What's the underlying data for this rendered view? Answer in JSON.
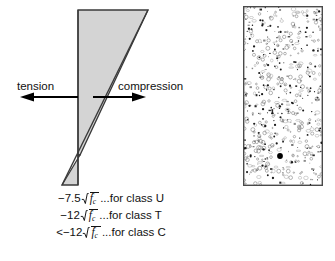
{
  "figure": {
    "stress_diagram": {
      "tension_label": "tension",
      "compression_label": "compression",
      "tension_arrow_direction": "left",
      "compression_arrow_direction": "right",
      "fill_color": "#d4d4d4",
      "outline_color": "#3a3a3a",
      "neutral_axis_y_fraction": 0.83,
      "description": "Linear stress diagram: compression block above neutral axis, tension wedge below"
    },
    "formulas": [
      {
        "prefix": "−7.5",
        "radicand_symbol": "f",
        "radicand_prime": "′",
        "radicand_subscript": "c",
        "suffix": "...for class U",
        "class": "U"
      },
      {
        "prefix": "−12",
        "radicand_symbol": "f",
        "radicand_prime": "′",
        "radicand_subscript": "c",
        "suffix": "...for class T",
        "class": "T"
      },
      {
        "prefix": "<−12",
        "radicand_symbol": "f",
        "radicand_prime": "′",
        "radicand_subscript": "c",
        "suffix": "...for class C",
        "class": "C"
      }
    ],
    "concrete_section": {
      "name": "concrete-cross-section",
      "border_color": "#4a4a4a",
      "fill_color": "#ffffff",
      "texture": "aggregate-speckle",
      "tendon_marker": {
        "shape": "filled-circle",
        "color": "#000000",
        "x_fraction": 0.46,
        "y_fraction": 0.83
      }
    }
  },
  "chart_data": {
    "type": "area",
    "xlabel": "stress",
    "ylabel": "depth",
    "series": [
      {
        "name": "compression",
        "x": [
          0,
          1
        ],
        "values": [
          1.0,
          0.0
        ],
        "region": "above-neutral-axis"
      },
      {
        "name": "tension",
        "x": [
          0,
          -0.22
        ],
        "values": [
          0.0,
          -0.17
        ],
        "region": "below-neutral-axis"
      }
    ],
    "annotations": [
      "tension",
      "compression"
    ],
    "grid": false,
    "legend": "none"
  }
}
